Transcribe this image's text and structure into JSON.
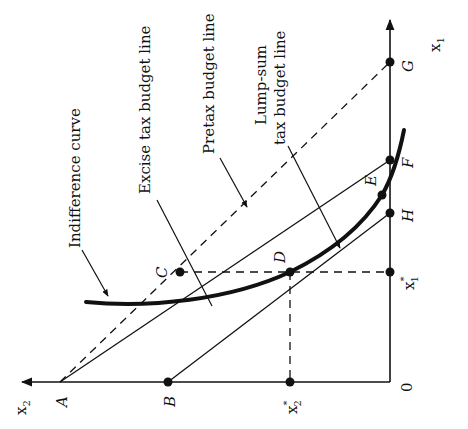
{
  "diagram": {
    "axes": {
      "vertical_label": "x",
      "vertical_sub": "1",
      "horizontal_label": "x",
      "horizontal_sub": "2",
      "origin_label": "0"
    },
    "points": {
      "A": "A",
      "B": "B",
      "C": "C",
      "D": "D",
      "E": "E",
      "F": "F",
      "G": "G",
      "H": "H"
    },
    "tick_labels": {
      "x1_star": "x",
      "x1_star_sub": "1",
      "x2_star": "x",
      "x2_star_sub": "2",
      "star": "*"
    },
    "annotations": {
      "indifference_curve": "Indifference curve",
      "excise_tax_budget_line": "Excise tax budget line",
      "pretax_budget_line": "Pretax budget line",
      "lump_sum_line1": "Lump-sum",
      "lump_sum_line2": "tax budget line"
    },
    "colors": {
      "ink": "#111111",
      "background": "#ffffff"
    }
  }
}
